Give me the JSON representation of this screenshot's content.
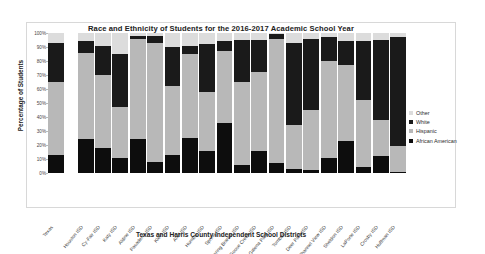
{
  "chart_data": {
    "type": "bar",
    "variant": "stacked-percentage",
    "title": "Race and Ethnicity of Students for the 2016-2017 Academic School Year",
    "xlabel": "Texas and Harris County Independent School Districts",
    "ylabel": "Percentage of Students",
    "ylim": [
      0,
      100
    ],
    "ytick_labels": [
      "100%",
      "90%",
      "80%",
      "70%",
      "60%",
      "50%",
      "40%",
      "30%",
      "20%",
      "10%",
      "0%"
    ],
    "ytick_values": [
      100,
      90,
      80,
      70,
      60,
      50,
      40,
      30,
      20,
      10,
      0
    ],
    "grid": false,
    "legend_position": "right",
    "categories": [
      "Texas",
      "Houston ISD",
      "Cy-Fair ISD",
      "Katy ISD",
      "Aldine ISD",
      "Pasadena ISD",
      "Klein ISD",
      "Alief ISD",
      "Humble ISD",
      "Spring ISD",
      "Spring Branch ISD",
      "Goose Creek ISD",
      "Galena Park ISD",
      "Tomball ISD",
      "Deer Park ISD",
      "Channel View ISD",
      "Sheldon ISD",
      "LaPorte ISD",
      "Crosby ISD",
      "Huffman ISD"
    ],
    "series": [
      {
        "name": "African American",
        "color": "#0d0d0d",
        "values": [
          13,
          24,
          18,
          11,
          24,
          8,
          13,
          25,
          16,
          36,
          6,
          16,
          7,
          3,
          2,
          11,
          23,
          4,
          12,
          1
        ]
      },
      {
        "name": "Hispanic",
        "color": "#b8b8b8",
        "values": [
          52,
          62,
          52,
          36,
          72,
          85,
          49,
          60,
          42,
          51,
          59,
          56,
          89,
          31,
          43,
          69,
          54,
          48,
          26,
          18
        ]
      },
      {
        "name": "White",
        "color": "#1a1a1a",
        "values": [
          28,
          8,
          21,
          38,
          2,
          5,
          28,
          6,
          34,
          7,
          30,
          23,
          3,
          59,
          51,
          17,
          17,
          42,
          57,
          78
        ]
      },
      {
        "name": "Other",
        "color": "#dcdcdc",
        "values": [
          7,
          6,
          9,
          15,
          2,
          2,
          10,
          9,
          8,
          6,
          5,
          5,
          1,
          7,
          4,
          3,
          6,
          6,
          5,
          3
        ]
      }
    ]
  },
  "legend": {
    "items": [
      {
        "label": "Other",
        "color": "#dcdcdc"
      },
      {
        "label": "White",
        "color": "#1a1a1a"
      },
      {
        "label": "Hispanic",
        "color": "#b8b8b8"
      },
      {
        "label": "African American",
        "color": "#0d0d0d"
      }
    ]
  }
}
